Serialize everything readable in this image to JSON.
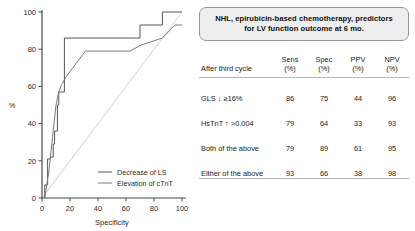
{
  "chart_data": {
    "type": "line",
    "title": "",
    "xlabel": "Specificity",
    "ylabel": "%",
    "xlim": [
      0,
      100
    ],
    "ylim": [
      0,
      100
    ],
    "xticks": [
      0,
      20,
      40,
      60,
      80,
      100
    ],
    "yticks": [
      0,
      20,
      40,
      60,
      80,
      100
    ],
    "grid": false,
    "legend_position": "bottom-right",
    "series": [
      {
        "name": "Decrease of LS",
        "color": "#555555",
        "style": "step",
        "points": [
          [
            2,
            0
          ],
          [
            2,
            7
          ],
          [
            4,
            7
          ],
          [
            4,
            21
          ],
          [
            6,
            21
          ],
          [
            6,
            22
          ],
          [
            8,
            22
          ],
          [
            8,
            29
          ],
          [
            9,
            29
          ],
          [
            9,
            36
          ],
          [
            11,
            36
          ],
          [
            11,
            50
          ],
          [
            12,
            50
          ],
          [
            12,
            57
          ],
          [
            14,
            57
          ],
          [
            14,
            57
          ],
          [
            16,
            57
          ],
          [
            16,
            86
          ],
          [
            63,
            86
          ],
          [
            63,
            86
          ],
          [
            70,
            86
          ],
          [
            70,
            93
          ],
          [
            86,
            93
          ],
          [
            86,
            100
          ],
          [
            95,
            100
          ],
          [
            100,
            100
          ]
        ]
      },
      {
        "name": "Elevation of cTnT",
        "color": "#7a7a7a",
        "style": "line",
        "points": [
          [
            2,
            0
          ],
          [
            5,
            15
          ],
          [
            8,
            36
          ],
          [
            10,
            50
          ],
          [
            12,
            57
          ],
          [
            14,
            61
          ],
          [
            18,
            66
          ],
          [
            24,
            72
          ],
          [
            31,
            79
          ],
          [
            63,
            79
          ],
          [
            70,
            82
          ],
          [
            86,
            86
          ],
          [
            95,
            93
          ],
          [
            100,
            93
          ]
        ]
      },
      {
        "name": "Reference diagonal",
        "color": "#d0d0d0",
        "style": "diagonal",
        "points": [
          [
            0,
            0
          ],
          [
            100,
            100
          ]
        ]
      }
    ],
    "legend": [
      {
        "label": "Decrease of LS",
        "color": "#555555"
      },
      {
        "label": "Elevation of cTnT",
        "color": "#7a7a7a"
      }
    ]
  },
  "title_box": {
    "line1": "NHL, epirubicin-based chemotherapy, predictors",
    "line2": "for LV function outcome at 6 mo."
  },
  "table": {
    "headers": [
      {
        "top": "After third cycle",
        "bottom": ""
      },
      {
        "top": "Sens",
        "bottom": "(%)"
      },
      {
        "top": "Spec",
        "bottom": "(%)"
      },
      {
        "top": "PPV",
        "bottom": "(%)"
      },
      {
        "top": "NPV",
        "bottom": "(%)"
      }
    ],
    "rows": [
      {
        "name": "GLS ↓ ≥16%",
        "sens": "86",
        "spec": "75",
        "ppv": "44",
        "npv": "96"
      },
      {
        "name": "HsTnT ↑ >0.004",
        "sens": "79",
        "spec": "64",
        "ppv": "33",
        "npv": "93"
      },
      {
        "name": "Both of the above",
        "sens": "79",
        "spec": "89",
        "ppv": "61",
        "npv": "95"
      },
      {
        "name": "Either of the above",
        "sens": "93",
        "spec": "66",
        "ppv": "38",
        "npv": "98"
      }
    ]
  }
}
